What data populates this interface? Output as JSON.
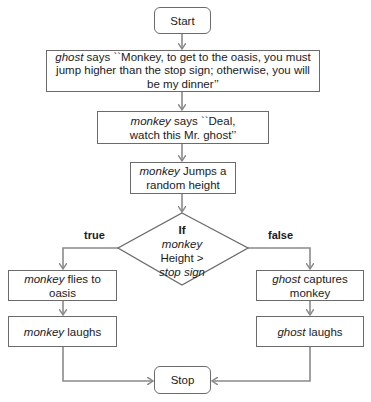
{
  "flowchart": {
    "start": {
      "label": "Start"
    },
    "ghost_says": {
      "actor": "ghost",
      "text": " says ``Monkey, to get to the oasis, you must jump higher than the stop sign; otherwise, you will be my dinner’’"
    },
    "monkey_says": {
      "actor": "monkey",
      "text": " says ``Deal, watch this Mr. ghost’’"
    },
    "monkey_jumps": {
      "actor": "monkey",
      "text": " Jumps a random height"
    },
    "decision": {
      "keyword": "If",
      "actor": "monkey",
      "line3": "Height >",
      "line4": "stop sign"
    },
    "branch_true": {
      "label": "true"
    },
    "branch_false": {
      "label": "false"
    },
    "monkey_flies": {
      "actor": "monkey",
      "text": " flies to oasis"
    },
    "monkey_laughs": {
      "actor": "monkey",
      "text": " laughs"
    },
    "ghost_captures": {
      "actor": "ghost",
      "text": " captures monkey"
    },
    "ghost_laughs": {
      "actor": "ghost",
      "text": " laughs"
    },
    "stop": {
      "label": "Stop"
    }
  },
  "colors": {
    "border": "#6b6b6b",
    "arrow": "#8a8a8a",
    "text": "#1a1a1a"
  }
}
